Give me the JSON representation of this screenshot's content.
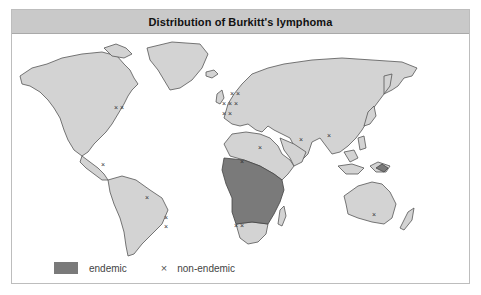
{
  "figure": {
    "title": "Distribution of Burkitt's lymphoma",
    "legend": [
      {
        "symbol": "filled-swatch",
        "label": "endemic",
        "color": "#7a7a7a"
      },
      {
        "symbol": "×",
        "label": "non-endemic",
        "color": "#555555"
      }
    ],
    "colors": {
      "land": "#d3d3d3",
      "endemic": "#7a7a7a",
      "outline": "#555555",
      "title_bar": "#c9c9c9"
    },
    "endemic_regions": [
      "Equatorial Africa",
      "Papua New Guinea"
    ],
    "non_endemic_markers": [
      "North America",
      "Mexico",
      "Northern South America",
      "Eastern Brazil",
      "Europe",
      "Middle East",
      "India",
      "Southeast Asia",
      "South Africa",
      "Australia"
    ]
  }
}
